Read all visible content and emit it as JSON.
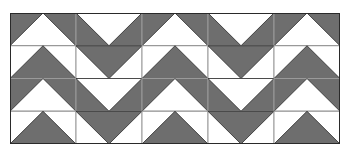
{
  "pattern": {
    "title": "Flying geese chevron quilt pattern",
    "rows": 4,
    "cols": 5,
    "colors": {
      "dark": "#6e6e6e",
      "light": "#ffffff",
      "stroke": "#2a2a2a",
      "grid": "#9a9a9a"
    },
    "cells": [
      [
        "up-light",
        "down-light",
        "up-light",
        "down-light",
        "up-light"
      ],
      [
        "up-dark",
        "down-dark",
        "up-dark",
        "down-dark",
        "up-dark"
      ],
      [
        "up-light",
        "down-light",
        "up-light",
        "down-light",
        "up-light"
      ],
      [
        "up-dark",
        "down-dark",
        "up-dark",
        "down-dark",
        "up-dark"
      ]
    ]
  }
}
